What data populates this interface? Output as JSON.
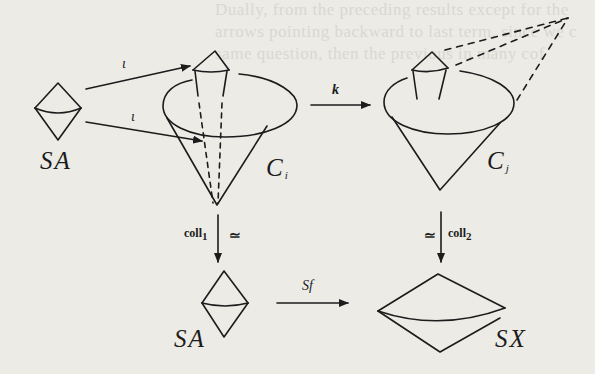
{
  "diagram": {
    "nodes": {
      "sa_top": {
        "label": "SA"
      },
      "ci": {
        "label": "C",
        "sub": "i"
      },
      "cj": {
        "label": "C",
        "sub": "j"
      },
      "sa_bottom": {
        "label": "SA"
      },
      "sx": {
        "label": "SX"
      }
    },
    "edges": {
      "iota_upper": {
        "label": "ι"
      },
      "iota_lower": {
        "label": "ι"
      },
      "k": {
        "label": "k"
      },
      "coll1": {
        "label": "coll",
        "sub": "1",
        "mark": "≃"
      },
      "coll2": {
        "label": "coll",
        "sub": "2",
        "mark": "≃"
      },
      "sf": {
        "label": "Sf"
      }
    },
    "colors": {
      "ink": "#1c1c1c",
      "paper": "#ecebe6",
      "bleed": "#d9d8d2"
    }
  },
  "bleed_through_text": [
    "Dually, from the preceding results except for the",
    "arrows pointing backward to last term, since we c",
    "same question, then the previous in many cof"
  ]
}
